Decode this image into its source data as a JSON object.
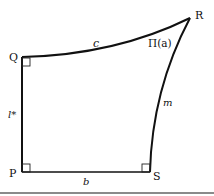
{
  "diagram": {
    "vertices": {
      "Q": {
        "label": "Q",
        "x": 22,
        "y": 57
      },
      "P": {
        "label": "P",
        "x": 22,
        "y": 172
      },
      "S": {
        "label": "S",
        "x": 150,
        "y": 172
      },
      "R": {
        "label": "R",
        "x": 190,
        "y": 18
      }
    },
    "edges": {
      "c": {
        "label": "c",
        "from": "Q",
        "to": "R",
        "curved": true
      },
      "l_star": {
        "label": "l*",
        "from": "Q",
        "to": "P"
      },
      "b": {
        "label": "b",
        "from": "P",
        "to": "S"
      },
      "m": {
        "label": "m",
        "from": "S",
        "to": "R",
        "curved": true
      }
    },
    "angle_label": "Π(a)",
    "right_angles": [
      "Q",
      "P",
      "S"
    ],
    "colors": {
      "stroke": "#111111",
      "rule": "#8a8a8a"
    }
  }
}
